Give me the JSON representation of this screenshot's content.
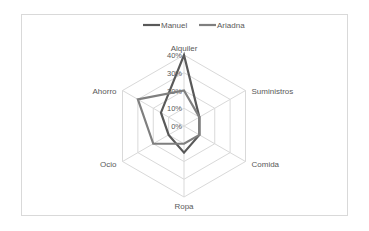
{
  "chart_data": {
    "type": "radar",
    "title": "",
    "categories": [
      "Alquiler",
      "Suministros",
      "Comida",
      "Ropa",
      "Ocio",
      "Ahorro"
    ],
    "series": [
      {
        "name": "Manuel",
        "values": [
          40,
          10,
          10,
          15,
          10,
          15
        ],
        "color": "#595959"
      },
      {
        "name": "Ariadna",
        "values": [
          20,
          10,
          10,
          10,
          20,
          30
        ],
        "color": "#7f7f7f"
      }
    ],
    "radial_ticks": [
      "0%",
      "10%",
      "20%",
      "30%",
      "40%"
    ],
    "rmax": 40,
    "legend_position": "top",
    "grid": true
  }
}
